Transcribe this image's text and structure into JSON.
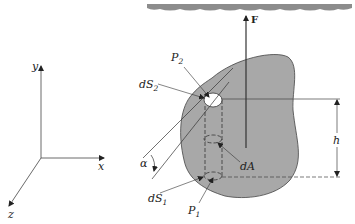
{
  "figure": {
    "type": "physics-diagram"
  },
  "axes": {
    "x_label": "x",
    "y_label": "y",
    "z_label": "z"
  },
  "labels": {
    "force": "F",
    "p2_base": "P",
    "p2_sub": "2",
    "ds2_base": "dS",
    "ds2_sub": "2",
    "ds1_base": "dS",
    "ds1_sub": "1",
    "p1_base": "P",
    "p1_sub": "1",
    "dA": "dA",
    "alpha": "α",
    "height": "h"
  },
  "colors": {
    "body_fill": "#a8a8a8",
    "surface_fill": "#8c8c8c",
    "line": "#333333",
    "hole_fill": "#ffffff"
  }
}
